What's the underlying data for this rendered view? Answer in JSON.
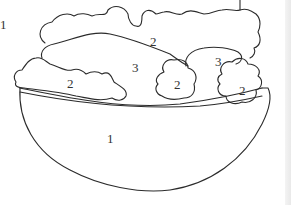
{
  "figure": {
    "style": "paint-by-number line art",
    "stroke_color": "#2b2b2b",
    "background": "#ffffff"
  },
  "callout": {
    "marker": "1"
  },
  "regions": [
    {
      "id": "bowl",
      "number": "1",
      "x": 107,
      "y": 156
    },
    {
      "id": "lettuce-top-center",
      "number": "2",
      "x": 150,
      "y": 37
    },
    {
      "id": "lettuce-left",
      "number": "2",
      "x": 67,
      "y": 79
    },
    {
      "id": "lettuce-middle-large",
      "number": "3",
      "x": 132,
      "y": 63
    },
    {
      "id": "lettuce-right-upper",
      "number": "3",
      "x": 215,
      "y": 57
    },
    {
      "id": "lettuce-center-small",
      "number": "2",
      "x": 174,
      "y": 80
    },
    {
      "id": "lettuce-right-small",
      "number": "2",
      "x": 239,
      "y": 86
    }
  ]
}
